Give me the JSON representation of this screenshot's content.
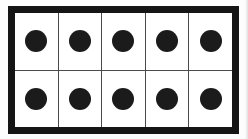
{
  "figure": {
    "type": "array-grid",
    "rows": 2,
    "columns": 5,
    "total_counters": 10,
    "caption": ""
  },
  "colors": {
    "frame": "#151515",
    "divider": "#4a4a4a",
    "cell_fill": "#ffffff",
    "counter": "#1b1b1b",
    "page_background": "#fdfdfd"
  },
  "geometry": {
    "frame_border_width_px": 7,
    "divider_width_px": 1.5,
    "counter_diameter_px": 22
  },
  "grid": {
    "rows": [
      {
        "row_label": "row-1",
        "cells": [
          {
            "cell_label": "r1c1",
            "counter": true,
            "counter_icon": "filled-circle-icon"
          },
          {
            "cell_label": "r1c2",
            "counter": true,
            "counter_icon": "filled-circle-icon"
          },
          {
            "cell_label": "r1c3",
            "counter": true,
            "counter_icon": "filled-circle-icon"
          },
          {
            "cell_label": "r1c4",
            "counter": true,
            "counter_icon": "filled-circle-icon"
          },
          {
            "cell_label": "r1c5",
            "counter": true,
            "counter_icon": "filled-circle-icon"
          }
        ]
      },
      {
        "row_label": "row-2",
        "cells": [
          {
            "cell_label": "r2c1",
            "counter": true,
            "counter_icon": "filled-circle-icon"
          },
          {
            "cell_label": "r2c2",
            "counter": true,
            "counter_icon": "filled-circle-icon"
          },
          {
            "cell_label": "r2c3",
            "counter": true,
            "counter_icon": "filled-circle-icon"
          },
          {
            "cell_label": "r2c4",
            "counter": true,
            "counter_icon": "filled-circle-icon"
          },
          {
            "cell_label": "r2c5",
            "counter": true,
            "counter_icon": "filled-circle-icon"
          }
        ]
      }
    ]
  }
}
